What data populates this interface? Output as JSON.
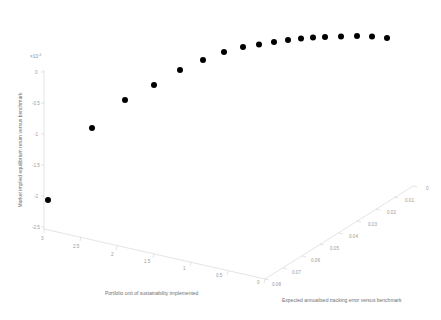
{
  "chart_data": {
    "type": "scatter",
    "projection": "3d",
    "title": "",
    "subtitle": "",
    "marker_color": "#000000",
    "marker_shape": "circle",
    "grid": false,
    "legend": null,
    "background_color": "#ffffff",
    "axis_color": "#d9d9d9",
    "tick_label_color": "#9a9a9a",
    "y_exponent_label": "×10",
    "y_exponent_superscript": "-3",
    "xlabel": "Portfolio unit of sustainability implemented",
    "ylabel": "Market implied equilibrium return versus benchmark",
    "zlabel": "Expected annualised tracking error versus benchmark",
    "xlim": [
      0,
      3
    ],
    "ylim": [
      -2.5,
      0
    ],
    "zlim": [
      0,
      0.08
    ],
    "x_reversed": true,
    "z_reversed": true,
    "xticks": [
      "3",
      "2.5",
      "2",
      "1.5",
      "1",
      "0.5",
      "0"
    ],
    "xtick_values": [
      3,
      2.5,
      2,
      1.5,
      1,
      0.5,
      0
    ],
    "yticks": [
      "0",
      "-0.5",
      "-1",
      "-1.5",
      "-2",
      "-2.5"
    ],
    "ytick_values": [
      0,
      -0.5,
      -1,
      -1.5,
      -2,
      -2.5
    ],
    "zticks": [
      "0",
      "0.01",
      "0.02",
      "0.03",
      "0.04",
      "0.05",
      "0.06",
      "0.07",
      "0.08"
    ],
    "ztick_values": [
      0,
      0.01,
      0.02,
      0.03,
      0.04,
      0.05,
      0.06,
      0.07,
      0.08
    ],
    "n_points": 18,
    "x": [
      3.0,
      2.6,
      2.3,
      2.0,
      1.75,
      1.5,
      1.3,
      1.1,
      0.95,
      0.8,
      0.65,
      0.55,
      0.45,
      0.35,
      0.27,
      0.2,
      0.13,
      0.06
    ],
    "y": [
      -2.1,
      -1.08,
      -0.63,
      -0.39,
      -0.25,
      -0.155,
      -0.095,
      -0.062,
      -0.04,
      -0.026,
      -0.018,
      -0.012,
      -0.008,
      -0.005,
      -0.003,
      -0.002,
      -0.001,
      -0.004
    ],
    "z": [
      0.08,
      0.074,
      0.068,
      0.062,
      0.056,
      0.05,
      0.045,
      0.04,
      0.035,
      0.031,
      0.027,
      0.023,
      0.019,
      0.016,
      0.013,
      0.01,
      0.007,
      0.004
    ],
    "pixel_points": [
      {
        "cx": 48.0,
        "cy": 200.0
      },
      {
        "cx": 92.0,
        "cy": 128.0
      },
      {
        "cx": 125.0,
        "cy": 100.0
      },
      {
        "cx": 154.0,
        "cy": 85.0
      },
      {
        "cx": 180.0,
        "cy": 70.0
      },
      {
        "cx": 203.0,
        "cy": 60.0
      },
      {
        "cx": 224.0,
        "cy": 52.0
      },
      {
        "cx": 243.0,
        "cy": 47.0
      },
      {
        "cx": 259.0,
        "cy": 44.5
      },
      {
        "cx": 274.0,
        "cy": 42.0
      },
      {
        "cx": 288.0,
        "cy": 40.0
      },
      {
        "cx": 301.0,
        "cy": 38.5
      },
      {
        "cx": 313.0,
        "cy": 37.5
      },
      {
        "cx": 325.0,
        "cy": 37.0
      },
      {
        "cx": 341.0,
        "cy": 36.5
      },
      {
        "cx": 357.0,
        "cy": 36.0
      },
      {
        "cx": 372.0,
        "cy": 36.5
      },
      {
        "cx": 387.0,
        "cy": 38.0
      }
    ],
    "marker_radius": 3.0
  },
  "axes": {
    "y_axis": {
      "name": "vertical-axis",
      "exponent": "×10",
      "exponent_sup": "-3",
      "title": "Market implied equilibrium return versus benchmark",
      "ticks": [
        {
          "label": "0",
          "x": 35,
          "y": 73.5
        },
        {
          "label": "-0.5",
          "x": 32,
          "y": 104.5
        },
        {
          "label": "-1",
          "x": 34,
          "y": 135.5
        },
        {
          "label": "-1.5",
          "x": 32,
          "y": 166.5
        },
        {
          "label": "-2",
          "x": 34,
          "y": 197.5
        },
        {
          "label": "-2.5",
          "x": 32,
          "y": 228.5
        }
      ],
      "tick_marks": [
        {
          "x1": 41,
          "y1": 72,
          "x2": 44,
          "y2": 72
        },
        {
          "x1": 41,
          "y1": 103,
          "x2": 44,
          "y2": 103
        },
        {
          "x1": 41,
          "y1": 134,
          "x2": 44,
          "y2": 134
        },
        {
          "x1": 41,
          "y1": 165,
          "x2": 44,
          "y2": 165
        },
        {
          "x1": 41,
          "y1": 196,
          "x2": 44,
          "y2": 196
        },
        {
          "x1": 41,
          "y1": 227,
          "x2": 44,
          "y2": 227
        }
      ],
      "line": {
        "x1": 44,
        "y1": 70,
        "x2": 44,
        "y2": 229
      }
    },
    "x_axis": {
      "name": "left-bottom-axis",
      "title": "Portfolio unit of sustainability implemented",
      "line": {
        "x1": 44,
        "y1": 229,
        "x2": 265,
        "y2": 279
      },
      "ticks": [
        {
          "label": "3",
          "x": 41,
          "y": 240
        },
        {
          "label": "2.5",
          "x": 73,
          "y": 248
        },
        {
          "label": "2",
          "x": 111,
          "y": 256
        },
        {
          "label": "1.5",
          "x": 144,
          "y": 263
        },
        {
          "label": "1",
          "x": 183,
          "y": 270
        },
        {
          "label": "0.5",
          "x": 216,
          "y": 277
        },
        {
          "label": "0",
          "x": 257,
          "y": 284
        }
      ],
      "tick_marks": [
        {
          "x1": 44,
          "y1": 229,
          "x2": 44,
          "y2": 233
        },
        {
          "x1": 81,
          "y1": 237,
          "x2": 80,
          "y2": 241
        },
        {
          "x1": 117,
          "y1": 246,
          "x2": 116,
          "y2": 250
        },
        {
          "x1": 154,
          "y1": 254,
          "x2": 153,
          "y2": 258
        },
        {
          "x1": 191,
          "y1": 262,
          "x2": 190,
          "y2": 266
        },
        {
          "x1": 228,
          "y1": 271,
          "x2": 227,
          "y2": 275
        },
        {
          "x1": 265,
          "y1": 279,
          "x2": 264,
          "y2": 283
        }
      ]
    },
    "z_axis": {
      "name": "right-bottom-axis",
      "title": "Expected annualised tracking error versus benchmark",
      "line": {
        "x1": 265,
        "y1": 279,
        "x2": 413,
        "y2": 186
      },
      "ticks": [
        {
          "label": "0.08",
          "x": 272,
          "y": 286
        },
        {
          "label": "0.07",
          "x": 292,
          "y": 274
        },
        {
          "label": "0.06",
          "x": 311,
          "y": 262
        },
        {
          "label": "0.05",
          "x": 330,
          "y": 250
        },
        {
          "label": "0.04",
          "x": 349,
          "y": 238
        },
        {
          "label": "0.03",
          "x": 368,
          "y": 226
        },
        {
          "label": "0.02",
          "x": 387,
          "y": 214
        },
        {
          "label": "0.01",
          "x": 405,
          "y": 202
        },
        {
          "label": "0",
          "x": 426,
          "y": 190
        }
      ],
      "tick_marks": [
        {
          "x1": 265,
          "y1": 279,
          "x2": 269,
          "y2": 280
        },
        {
          "x1": 283,
          "y1": 268,
          "x2": 287,
          "y2": 269
        },
        {
          "x1": 302,
          "y1": 256,
          "x2": 306,
          "y2": 257
        },
        {
          "x1": 320,
          "y1": 244,
          "x2": 324,
          "y2": 245
        },
        {
          "x1": 339,
          "y1": 233,
          "x2": 343,
          "y2": 234
        },
        {
          "x1": 357,
          "y1": 221,
          "x2": 361,
          "y2": 222
        },
        {
          "x1": 376,
          "y1": 209,
          "x2": 380,
          "y2": 210
        },
        {
          "x1": 394,
          "y1": 197,
          "x2": 398,
          "y2": 198
        },
        {
          "x1": 413,
          "y1": 186,
          "x2": 417,
          "y2": 187
        }
      ]
    }
  },
  "titles": {
    "x_title_pos": {
      "x": 105,
      "y": 295
    },
    "z_title_pos": {
      "x": 282,
      "y": 302
    },
    "y_title_pos": {
      "x": 22,
      "y": 150
    }
  }
}
